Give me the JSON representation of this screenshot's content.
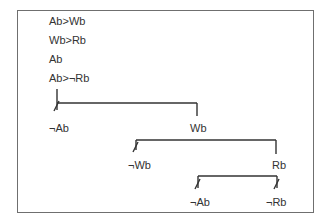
{
  "premises": [
    "Ab>Wb",
    "Wb>Rb",
    "Ab",
    "Ab>¬Rb"
  ],
  "tree": {
    "branch1": {
      "left": "¬Ab",
      "right": "Wb",
      "left_closed": true
    },
    "branch2": {
      "left": "¬Wb",
      "right": "Rb",
      "left_closed": true
    },
    "branch3": {
      "left": "¬Ab",
      "right": "¬Rb",
      "left_closed": true,
      "right_closed": true
    }
  },
  "colors": {
    "line": "#333333",
    "frame": "#6f6f6f",
    "text": "#333333"
  }
}
